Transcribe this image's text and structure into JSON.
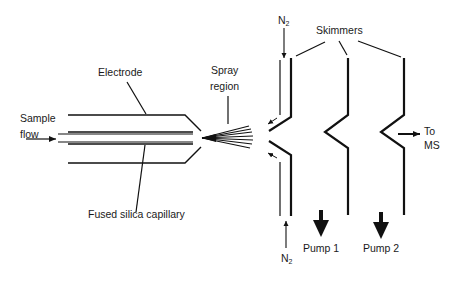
{
  "diagram": {
    "type": "electrospray ionization source schematic",
    "labels": {
      "sample_flow_line1": "Sample",
      "sample_flow_line2": "flow",
      "electrode": "Electrode",
      "fused_silica": "Fused silica capillary",
      "spray_line1": "Spray",
      "spray_line2": "region",
      "skimmers": "Skimmers",
      "n2_top": "N",
      "n2_top_sub": "2",
      "n2_bottom": "N",
      "n2_bottom_sub": "2",
      "pump1": "Pump 1",
      "pump2": "Pump 2",
      "to_ms_line1": "To",
      "to_ms_line2": "MS"
    },
    "components": [
      "Sample flow inlet",
      "Electrode",
      "Fused silica capillary",
      "Spray region",
      "N2 curtain gas",
      "Skimmer 1",
      "Skimmer 2",
      "Skimmer 3",
      "Pump 1",
      "Pump 2",
      "To MS"
    ],
    "colors": {
      "stroke": "#111111",
      "background": "#ffffff"
    }
  }
}
